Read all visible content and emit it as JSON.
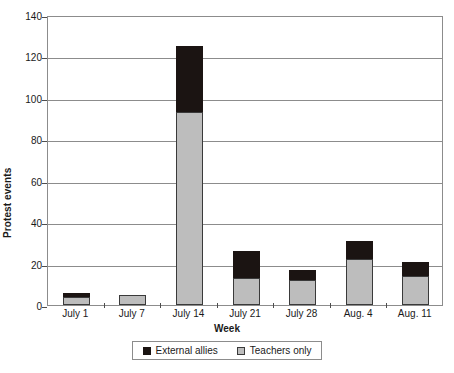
{
  "chart_data": {
    "type": "bar",
    "subtype": "stacked-bar",
    "title": "",
    "xlabel": "Week",
    "ylabel": "Protest events",
    "categories": [
      "July 1",
      "July 7",
      "July 14",
      "July 21",
      "July 28",
      "Aug. 4",
      "Aug. 11"
    ],
    "series": [
      {
        "name": "Teachers only",
        "color": "#bdbdbd",
        "values": [
          4,
          5,
          93,
          13,
          12,
          22,
          14
        ]
      },
      {
        "name": "External allies",
        "color": "#1b1412",
        "values": [
          2,
          0,
          32,
          13,
          5,
          9,
          7
        ]
      }
    ],
    "totals": [
      6,
      5,
      125,
      26,
      17,
      31,
      21
    ],
    "ylim": [
      0,
      140
    ],
    "yticks": [
      0,
      20,
      40,
      60,
      80,
      100,
      120,
      140
    ],
    "ytick_labels": [
      "0",
      "20",
      "40",
      "60",
      "80",
      "100",
      "120",
      "140"
    ],
    "grid": true,
    "legend_position": "bottom",
    "legend_order": [
      "External allies",
      "Teachers only"
    ]
  },
  "axes": {
    "y_title": "Protest events",
    "x_title": "Week"
  },
  "legend": {
    "items": [
      {
        "label": "External allies",
        "swatch": "black-square-icon"
      },
      {
        "label": "Teachers only",
        "swatch": "gray-square-icon"
      }
    ]
  }
}
